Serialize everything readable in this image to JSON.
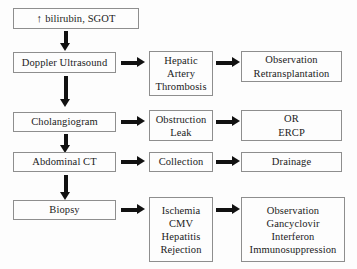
{
  "diagram": {
    "colors": {
      "background": "#fdfdfd",
      "box_border": "#8e8e8e",
      "arrow": "#111111",
      "text": "#1b1b1b"
    },
    "trigger": {
      "arrow_glyph": "↑",
      "label": "bilirubin, SGOT"
    },
    "rows": [
      {
        "test": "Doppler Ultrasound",
        "finding_lines": [
          "Hepatic",
          "Artery",
          "Thrombosis"
        ],
        "action_lines": [
          "Observation",
          "Retransplantation"
        ]
      },
      {
        "test": "Cholangiogram",
        "finding_lines": [
          "Obstruction",
          "Leak"
        ],
        "action_lines": [
          "OR",
          "ERCP"
        ]
      },
      {
        "test": "Abdominal CT",
        "finding_lines": [
          "Collection"
        ],
        "action_lines": [
          "Drainage"
        ]
      },
      {
        "test": "Biopsy",
        "finding_lines": [
          "Ischemia",
          "CMV",
          "Hepatitis",
          "Rejection"
        ],
        "action_lines": [
          "Observation",
          "Gancyclovir",
          "Interferon",
          "Immunosuppression"
        ]
      }
    ]
  }
}
